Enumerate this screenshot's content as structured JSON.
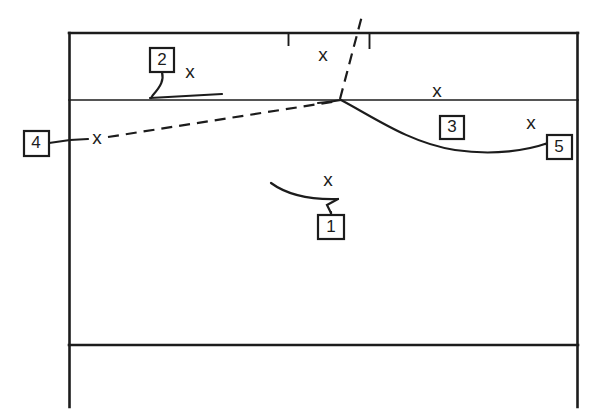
{
  "figure": {
    "kind": "technical-line-drawing",
    "background_color": "#ffffff",
    "ink_color": "#1c1c1c",
    "width": 594,
    "height": 418
  },
  "callouts": [
    {
      "id": "callout-1",
      "label": "1",
      "box": {
        "x": 318,
        "y": 215,
        "w": 26,
        "h": 24
      }
    },
    {
      "id": "callout-2",
      "label": "2",
      "box": {
        "x": 150,
        "y": 48,
        "w": 24,
        "h": 24
      }
    },
    {
      "id": "callout-3",
      "label": "3",
      "box": {
        "x": 440,
        "y": 116,
        "w": 24,
        "h": 23
      }
    },
    {
      "id": "callout-4",
      "label": "4",
      "box": {
        "x": 24,
        "y": 131,
        "w": 25,
        "h": 25
      }
    },
    {
      "id": "callout-5",
      "label": "5",
      "box": {
        "x": 547,
        "y": 135,
        "w": 25,
        "h": 24
      }
    }
  ],
  "section_markers": [
    {
      "id": "x-marker-upper-left",
      "label": "x",
      "x": 190,
      "y": 73
    },
    {
      "id": "x-marker-upper-center",
      "label": "x",
      "x": 323,
      "y": 56
    },
    {
      "id": "x-marker-mid-right",
      "label": "x",
      "x": 437,
      "y": 92
    },
    {
      "id": "x-marker-left-edge",
      "label": "x",
      "x": 97,
      "y": 139
    },
    {
      "id": "x-marker-right-edge",
      "label": "x",
      "x": 531,
      "y": 124
    },
    {
      "id": "x-marker-center-low",
      "label": "x",
      "x": 328,
      "y": 181
    }
  ],
  "frame": {
    "top_border_y": 33,
    "middle_border_y": 100,
    "lower_border_y": 345,
    "left_border_x": 69,
    "right_border_x": 578,
    "vertical_bottom_y": 407
  },
  "tick_marks": [
    {
      "id": "tick-left",
      "x": 288,
      "y_top": 33,
      "y_bottom": 46
    },
    {
      "id": "tick-right",
      "x": 369,
      "y_top": 33,
      "y_bottom": 49
    }
  ],
  "junction_point": {
    "x": 341,
    "y": 100
  }
}
